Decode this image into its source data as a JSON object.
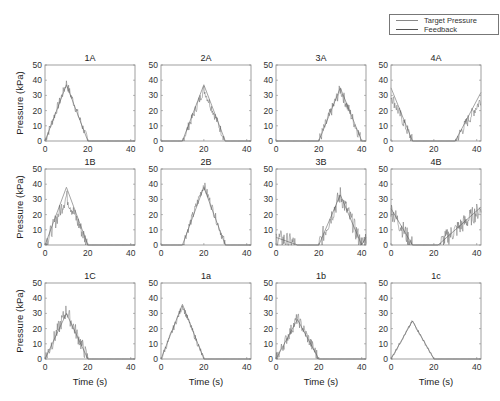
{
  "chart_data": {
    "type": "line",
    "layout": {
      "rows": 3,
      "cols": 4
    },
    "legend": {
      "position": "top-right",
      "entries": [
        "Target Pressure",
        "Feedback"
      ]
    },
    "shared": {
      "xlabel": "Time (s)",
      "ylabel": "Pressure (kPa)",
      "xlim": [
        0,
        42
      ],
      "ylim": [
        0,
        50
      ],
      "xticks": [
        0,
        20,
        40
      ],
      "yticks": [
        0,
        10,
        20,
        30,
        40,
        50
      ],
      "grid": false
    },
    "panels": [
      {
        "title": "1A",
        "target": [
          [
            0,
            0
          ],
          [
            10,
            37
          ],
          [
            20,
            0
          ],
          [
            42,
            0
          ]
        ],
        "feedback_peak": 38,
        "feedback_noise": 3
      },
      {
        "title": "2A",
        "target": [
          [
            0,
            0
          ],
          [
            10,
            0
          ],
          [
            20,
            37
          ],
          [
            30,
            0
          ],
          [
            42,
            0
          ]
        ],
        "feedback_peak": 34,
        "feedback_noise": 3
      },
      {
        "title": "3A",
        "target": [
          [
            0,
            0
          ],
          [
            20,
            0
          ],
          [
            30,
            35
          ],
          [
            40,
            0
          ],
          [
            42,
            0
          ]
        ],
        "feedback_peak": 34,
        "feedback_noise": 4
      },
      {
        "title": "4A",
        "target": [
          [
            0,
            35
          ],
          [
            10,
            0
          ],
          [
            30,
            0
          ],
          [
            42,
            32
          ]
        ],
        "feedback_peak": 30,
        "feedback_noise": 4
      },
      {
        "title": "1B",
        "target": [
          [
            0,
            0
          ],
          [
            10,
            38
          ],
          [
            20,
            0
          ],
          [
            42,
            0
          ]
        ],
        "feedback_peak": 32,
        "feedback_noise": 5
      },
      {
        "title": "2B",
        "target": [
          [
            0,
            0
          ],
          [
            10,
            0
          ],
          [
            20,
            38
          ],
          [
            30,
            0
          ],
          [
            42,
            0
          ]
        ],
        "feedback_peak": 40,
        "feedback_noise": 3
      },
      {
        "title": "3B",
        "target": [
          [
            0,
            5
          ],
          [
            10,
            0
          ],
          [
            20,
            0
          ],
          [
            30,
            33
          ],
          [
            40,
            0
          ],
          [
            42,
            5
          ]
        ],
        "feedback_peak": 33,
        "feedback_noise": 6
      },
      {
        "title": "4B",
        "target": [
          [
            0,
            24
          ],
          [
            10,
            0
          ],
          [
            22,
            0
          ],
          [
            42,
            25
          ]
        ],
        "feedback_peak": 24,
        "feedback_noise": 6
      },
      {
        "title": "1C",
        "target": [
          [
            0,
            0
          ],
          [
            10,
            30
          ],
          [
            20,
            0
          ],
          [
            42,
            0
          ]
        ],
        "feedback_peak": 32,
        "feedback_noise": 5
      },
      {
        "title": "1a",
        "target": [
          [
            0,
            0
          ],
          [
            10,
            36
          ],
          [
            20,
            0
          ],
          [
            42,
            0
          ]
        ],
        "feedback_peak": 35,
        "feedback_noise": 2
      },
      {
        "title": "1b",
        "target": [
          [
            0,
            0
          ],
          [
            10,
            26
          ],
          [
            20,
            0
          ],
          [
            42,
            0
          ]
        ],
        "feedback_peak": 27,
        "feedback_noise": 4
      },
      {
        "title": "1c",
        "target": [
          [
            0,
            0
          ],
          [
            10,
            25
          ],
          [
            20,
            0
          ],
          [
            42,
            0
          ]
        ],
        "feedback_peak": 25,
        "feedback_noise": 1
      }
    ]
  },
  "legend": {
    "target_label": "Target Pressure",
    "feedback_label": "Feedback"
  },
  "colors": {
    "axis": "#666666",
    "target": "#9a9a9a",
    "feedback": "#555555",
    "text": "#333333"
  }
}
